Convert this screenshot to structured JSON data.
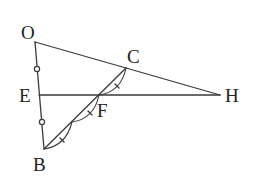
{
  "diagram": {
    "type": "geometry",
    "colors": {
      "stroke": "#3a3a3a",
      "label": "#222222",
      "background": "#ffffff"
    },
    "points": {
      "O": {
        "label": "O",
        "x": 35,
        "y": 42,
        "label_x": 21,
        "label_y": 39
      },
      "C": {
        "label": "C",
        "x": 126,
        "y": 68,
        "label_x": 127,
        "label_y": 63
      },
      "E": {
        "label": "E",
        "x": 39,
        "y": 95,
        "label_x": 19,
        "label_y": 102
      },
      "H": {
        "label": "H",
        "x": 220,
        "y": 95,
        "label_x": 225,
        "label_y": 102
      },
      "F": {
        "label": "F",
        "x": 99,
        "y": 95,
        "label_x": 97,
        "label_y": 117
      },
      "B": {
        "label": "B",
        "x": 44,
        "y": 149,
        "label_x": 33,
        "label_y": 171
      },
      "M": {
        "label": "",
        "x": 72,
        "y": 122
      }
    },
    "segments": [
      "OC",
      "CH",
      "EH",
      "OB",
      "BC"
    ],
    "equal_marks_circle": [
      {
        "x": 37,
        "y": 69
      },
      {
        "x": 42,
        "y": 122
      }
    ],
    "equal_arcs": [
      {
        "from": "B",
        "to": "M"
      },
      {
        "from": "M",
        "to": "F"
      },
      {
        "from": "F",
        "to": "C"
      }
    ]
  }
}
